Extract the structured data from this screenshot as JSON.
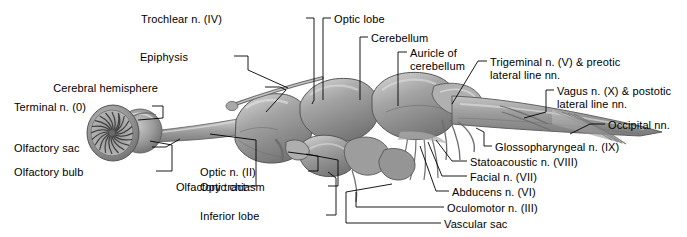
{
  "figure": {
    "background_color": "#ffffff",
    "text_color": "#000000",
    "leader_color": "#000000",
    "brain_fill": "#9a9a9a",
    "brain_shadow": "#6e6e6e",
    "brain_highlight": "#d8d8d8"
  },
  "labels": [
    {
      "id": "trochlear",
      "text": "Trochlear n. (IV)",
      "align": "left",
      "x": 222,
      "y": 13
    },
    {
      "id": "optic-lobe",
      "text": "Optic lobe",
      "align": "right",
      "x": 334,
      "y": 13
    },
    {
      "id": "cerebellum",
      "text": "Cerebellum",
      "align": "right",
      "x": 371,
      "y": 32
    },
    {
      "id": "epiphysis",
      "text": "Epiphysis",
      "align": "left",
      "x": 188,
      "y": 51
    },
    {
      "id": "auricle",
      "text": "Auricle of\ncerebellum",
      "align": "right",
      "x": 410,
      "y": 47
    },
    {
      "id": "trigeminal",
      "text": "Trigeminal n. (V) & preotic\nlateral line nn.",
      "align": "right",
      "x": 490,
      "y": 56
    },
    {
      "id": "cerebral-hemis",
      "text": "Cerebral hemisphere",
      "align": "left",
      "x": 158,
      "y": 82
    },
    {
      "id": "vagus",
      "text": "Vagus n. (X) & postotic\nlateral line nn.",
      "align": "right",
      "x": 557,
      "y": 85
    },
    {
      "id": "terminal",
      "text": "Terminal n. (0)",
      "align": "left",
      "x": 90,
      "y": 101
    },
    {
      "id": "occipital",
      "text": "Occipital nn.",
      "align": "right",
      "x": 608,
      "y": 119
    },
    {
      "id": "olfactory-sac",
      "text": "Olfactory sac",
      "align": "left",
      "x": 88,
      "y": 142
    },
    {
      "id": "glossopharyngeal",
      "text": "Glossopharyngeal n. (IX)",
      "align": "right",
      "x": 495,
      "y": 141
    },
    {
      "id": "statoacoustic",
      "text": "Statoacoustic n. (VIII)",
      "align": "right",
      "x": 470,
      "y": 156
    },
    {
      "id": "facial",
      "text": "Facial n. (VII)",
      "align": "right",
      "x": 470,
      "y": 171
    },
    {
      "id": "olfactory-bulb",
      "text": "Olfactory bulb",
      "align": "left",
      "x": 90,
      "y": 166
    },
    {
      "id": "abducens",
      "text": "Abducens n. (VI)",
      "align": "right",
      "x": 452,
      "y": 186
    },
    {
      "id": "optic-n",
      "text": "Optic n. (II)",
      "align": "left",
      "x": 254,
      "y": 166
    },
    {
      "id": "optic-chiasm",
      "text": "Optic chiasm",
      "align": "left",
      "x": 267,
      "y": 181
    },
    {
      "id": "olfactory-tract",
      "text": "Olfactory tract",
      "align": "left",
      "x": 180,
      "y": 181
    },
    {
      "id": "oculomotor",
      "text": "Oculomotor n. (III)",
      "align": "right",
      "x": 447,
      "y": 202
    },
    {
      "id": "inferior-lobe",
      "text": "Inferior lobe",
      "align": "left",
      "x": 267,
      "y": 210
    },
    {
      "id": "vascular-sac",
      "text": "Vascular sac",
      "align": "right",
      "x": 444,
      "y": 218
    }
  ]
}
